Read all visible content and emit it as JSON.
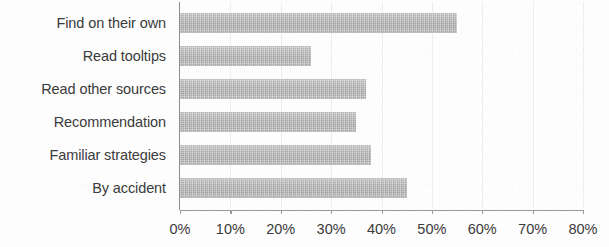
{
  "chart_data": {
    "type": "bar",
    "orientation": "horizontal",
    "title": "",
    "subtitle": "",
    "xlabel": "",
    "ylabel": "",
    "categories": [
      "Find on their own",
      "Read tooltips",
      "Read other sources",
      "Recommendation",
      "Familiar strategies",
      "By accident"
    ],
    "values": [
      55,
      26,
      37,
      35,
      38,
      45
    ],
    "value_suffix": "%",
    "xlim": [
      0,
      80
    ],
    "xticks": [
      0,
      10,
      20,
      30,
      40,
      50,
      60,
      70,
      80
    ],
    "xtick_labels": [
      "0%",
      "10%",
      "20%",
      "30%",
      "40%",
      "50%",
      "60%",
      "70%",
      "80%"
    ],
    "grid": "vertical-faint",
    "legend": "none",
    "bar_color": "#b4b4b4",
    "axis_color": "#9a9a9a",
    "text_color": "#3b3b3b",
    "background_color": "#fdfdfd",
    "data_labels": "none"
  }
}
